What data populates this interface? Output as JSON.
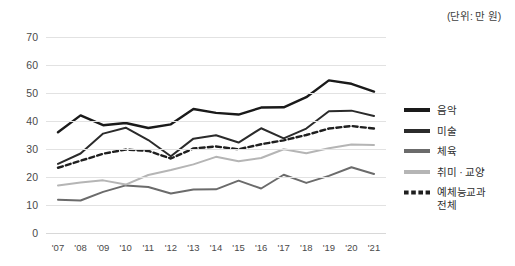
{
  "unit_note": "(단위: 만 원)",
  "legend": {
    "position": "right",
    "entries": [
      {
        "label": "음악",
        "color": "#1a1a1a",
        "style": "solid",
        "width": 2.6
      },
      {
        "label": "미술",
        "color": "#2b2b2b",
        "style": "solid",
        "width": 2.2
      },
      {
        "label": "체육",
        "color": "#6b6b6b",
        "style": "solid",
        "width": 1.9
      },
      {
        "label": "취미 · 교양",
        "color": "#b5b5b5",
        "style": "solid",
        "width": 1.9
      },
      {
        "label": "예체능교과\n전체",
        "color": "#1f1f1f",
        "style": "dashed",
        "width": 2.4
      }
    ]
  },
  "chart_data": {
    "type": "line",
    "title": "",
    "subtitle": "",
    "xlabel": "",
    "ylabel": "",
    "unit": "(단위: 만 원)",
    "grid": true,
    "legend_position": "right",
    "ylim": [
      0,
      70
    ],
    "yticks": [
      0,
      10,
      20,
      30,
      40,
      50,
      60,
      70
    ],
    "categories": [
      "'07",
      "'08",
      "'09",
      "'10",
      "'11",
      "'12",
      "'13",
      "'14",
      "'15",
      "'16",
      "'17",
      "'18",
      "'19",
      "'20",
      "'21"
    ],
    "series": [
      {
        "name": "음악",
        "color": "#1a1a1a",
        "style": "solid",
        "values": [
          36.0,
          42.0,
          38.5,
          39.3,
          37.5,
          38.8,
          44.3,
          42.9,
          42.3,
          44.8,
          44.9,
          48.5,
          54.5,
          53.3,
          50.5
        ]
      },
      {
        "name": "미술",
        "color": "#2b2b2b",
        "style": "solid",
        "values": [
          24.7,
          28.4,
          35.5,
          37.6,
          33.2,
          27.4,
          33.7,
          34.9,
          32.3,
          37.4,
          33.8,
          37.3,
          43.5,
          43.7,
          41.8
        ]
      },
      {
        "name": "체육",
        "color": "#6b6b6b",
        "style": "solid",
        "values": [
          11.9,
          11.6,
          14.7,
          17.0,
          16.4,
          14.1,
          15.5,
          15.6,
          18.7,
          15.9,
          20.8,
          17.9,
          20.4,
          23.5,
          21.1
        ]
      },
      {
        "name": "취미 · 교양",
        "color": "#b5b5b5",
        "style": "solid",
        "values": [
          17.0,
          18.0,
          18.8,
          17.3,
          20.7,
          22.5,
          24.5,
          27.2,
          25.6,
          26.8,
          29.9,
          28.5,
          30.3,
          31.6,
          31.4
        ]
      },
      {
        "name": "예체능교과 전체",
        "color": "#1f1f1f",
        "style": "dashed",
        "values": [
          23.3,
          25.8,
          28.3,
          29.8,
          29.3,
          26.6,
          30.2,
          30.9,
          29.9,
          31.7,
          33.1,
          35.0,
          37.3,
          38.2,
          37.3
        ]
      }
    ]
  }
}
